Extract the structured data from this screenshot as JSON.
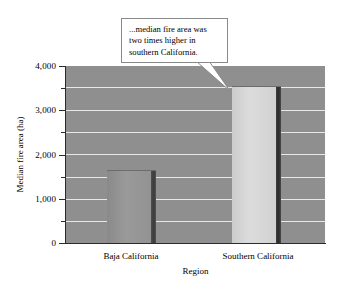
{
  "chart_data": {
    "type": "bar",
    "title": "",
    "subtitle": "",
    "xlabel": "Region",
    "ylabel": "Median fire area (ha)",
    "categories": [
      "Baja California",
      "Southern California"
    ],
    "values": [
      1650,
      3550
    ],
    "ylim": [
      0,
      4000
    ],
    "y_major_ticks": [
      0,
      1000,
      2000,
      3000,
      4000
    ],
    "y_major_tick_labels": [
      "0",
      "1,000",
      "2,000",
      "3,000",
      "4,000"
    ],
    "y_minor_ticks": [
      500,
      1500,
      2500,
      3500
    ],
    "grid": true,
    "grid_axis": "y",
    "grid_color": "#e8e8e8",
    "legend": "none",
    "plot_background": "#8f8f8f",
    "series": [
      {
        "name": "Median fire area",
        "values": [
          1650,
          3550
        ],
        "bar_colors": [
          "#939393",
          "#d6d6d6"
        ]
      }
    ],
    "annotations": [
      {
        "kind": "callout",
        "text": "...median fire area was two times higher in southern California.",
        "points_to_category": "Southern California",
        "points_to_value": 3550
      }
    ]
  },
  "axes": {
    "y_title": "Median fire area (ha)",
    "x_title": "Region",
    "y_tick_labels": [
      "4,000",
      "3,000",
      "2,000",
      "1,000",
      "0"
    ],
    "x_tick_labels": [
      "Baja California",
      "Southern California"
    ]
  },
  "callout": {
    "line1": "...median fire area was",
    "line2": "two times higher in",
    "line3": "southern California.",
    "full_text": "...median fire area was two times higher in southern California."
  }
}
